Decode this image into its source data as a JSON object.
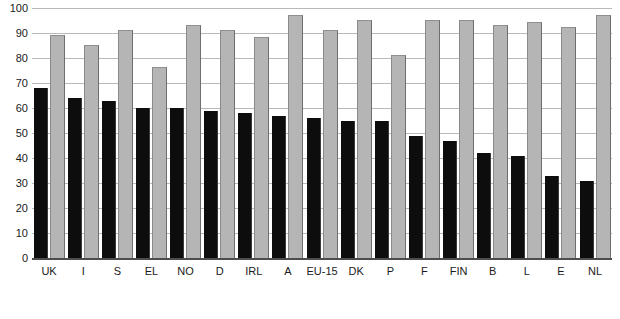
{
  "chart_data": {
    "type": "bar",
    "title": "",
    "subtitle": "",
    "xlabel": "",
    "ylabel": "",
    "ylim": [
      0,
      100
    ],
    "yticks": [
      100,
      90,
      80,
      70,
      60,
      50,
      40,
      30,
      20,
      10,
      0
    ],
    "grid": true,
    "legend_position": "none",
    "categories": [
      "UK",
      "I",
      "S",
      "EL",
      "NO",
      "D",
      "IRL",
      "A",
      "EU-15",
      "DK",
      "P",
      "F",
      "FIN",
      "B",
      "L",
      "E",
      "NL"
    ],
    "series": [
      {
        "name": "series-1",
        "color": "#0d0d0d",
        "values": [
          68,
          64,
          63,
          60,
          60,
          59,
          58,
          57,
          56,
          55,
          55,
          49,
          47,
          42,
          41,
          33,
          31
        ]
      },
      {
        "name": "series-2",
        "color": "#b5b5b5",
        "values": [
          89,
          85,
          91,
          76,
          93,
          91,
          88,
          97,
          91,
          95,
          81,
          95,
          95,
          93,
          94,
          92,
          97
        ]
      }
    ]
  },
  "colors": {
    "series_1": "#0d0d0d",
    "series_2": "#b5b5b5",
    "gridline": "#b9b9b9",
    "axis": "#4d4d4d",
    "background": "#ffffff",
    "text": "#1a1a1a"
  }
}
